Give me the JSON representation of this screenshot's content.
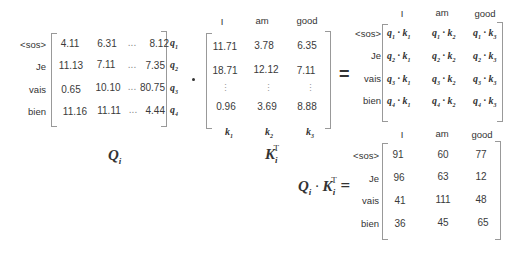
{
  "q_matrix": {
    "label": "Q",
    "label_sub": "i",
    "row_labels": [
      "<sos>",
      "Je",
      "vais",
      "bien"
    ],
    "rows": [
      [
        "4.11",
        "6.31",
        "...",
        "8.12"
      ],
      [
        "11.13",
        "7.11",
        "...",
        "7.35"
      ],
      [
        "0.65",
        "10.10",
        "...",
        "80.75"
      ],
      [
        "11.16",
        "11.11",
        "...",
        "4.44"
      ]
    ],
    "row_vectors": [
      {
        "name": "q",
        "sub": "1"
      },
      {
        "name": "q",
        "sub": "2"
      },
      {
        "name": "q",
        "sub": "3"
      },
      {
        "name": "q",
        "sub": "4"
      }
    ]
  },
  "operator_dot": "·",
  "k_matrix": {
    "label": "K",
    "label_sub": "i",
    "label_sup": "T",
    "col_headers": [
      "I",
      "am",
      "good"
    ],
    "rows": [
      [
        "11.71",
        "3.78",
        "6.35"
      ],
      [
        "18.71",
        "12.12",
        "7.11"
      ],
      [
        "⋮",
        "⋮",
        "⋮"
      ],
      [
        "0.96",
        "3.69",
        "8.88"
      ]
    ],
    "col_vectors": [
      {
        "name": "k",
        "sub": "1"
      },
      {
        "name": "k",
        "sub": "2"
      },
      {
        "name": "k",
        "sub": "3"
      }
    ]
  },
  "equals": "=",
  "symbolic_result": {
    "col_headers": [
      "I",
      "am",
      "good"
    ],
    "row_labels": [
      "<sos>",
      "Je",
      "vais",
      "bien"
    ],
    "cells": [
      [
        {
          "q": "1",
          "k": "1"
        },
        {
          "q": "1",
          "k": "2"
        },
        {
          "q": "1",
          "k": "3"
        }
      ],
      [
        {
          "q": "2",
          "k": "1"
        },
        {
          "q": "2",
          "k": "2"
        },
        {
          "q": "2",
          "k": "3"
        }
      ],
      [
        {
          "q": "3",
          "k": "1"
        },
        {
          "q": "3",
          "k": "2"
        },
        {
          "q": "3",
          "k": "3"
        }
      ],
      [
        {
          "q": "4",
          "k": "1"
        },
        {
          "q": "4",
          "k": "2"
        },
        {
          "q": "4",
          "k": "3"
        }
      ]
    ]
  },
  "numeric_result": {
    "equation": {
      "q": "Q",
      "q_sub": "i",
      "dot": "·",
      "k": "K",
      "k_sub": "i",
      "k_sup": "T",
      "eq": "="
    },
    "col_headers": [
      "I",
      "am",
      "good"
    ],
    "row_labels": [
      "<sos>",
      "Je",
      "vais",
      "bien"
    ],
    "rows": [
      [
        "91",
        "60",
        "77"
      ],
      [
        "96",
        "63",
        "12"
      ],
      [
        "41",
        "111",
        "48"
      ],
      [
        "36",
        "45",
        "65"
      ]
    ]
  }
}
